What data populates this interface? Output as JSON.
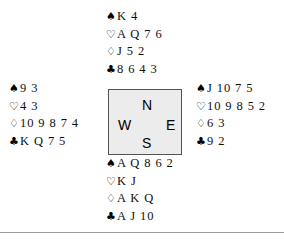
{
  "diagram": {
    "background_color": "#ffffff",
    "text_color": "#111111"
  },
  "suit_symbols": {
    "spade": "♠",
    "heart": "♡",
    "diamond": "♢",
    "club": "♣"
  },
  "compass": {
    "north_label": "N",
    "east_label": "E",
    "south_label": "S",
    "west_label": "W",
    "fill_color": "#ececec",
    "border_color": "#545454"
  },
  "hands": {
    "north": {
      "position_label": "North",
      "spades": "K 4",
      "hearts": "A Q 7 6",
      "diamonds": "J 5 2",
      "clubs": "8 6 4 3"
    },
    "west": {
      "position_label": "West",
      "spades": "9 3",
      "hearts": "4 3",
      "diamonds": "10 9 8 7 4",
      "clubs": "K Q 7 5"
    },
    "east": {
      "position_label": "East",
      "spades": "J 10 7 5",
      "hearts": "10 9 8 5 2",
      "diamonds": "6 3",
      "clubs": "9 2"
    },
    "south": {
      "position_label": "South",
      "spades": "A Q 8 6 2",
      "hearts": "K J",
      "diamonds": "A K Q",
      "clubs": "A J 10"
    }
  },
  "rule": {
    "color": "#9a9a9a"
  }
}
